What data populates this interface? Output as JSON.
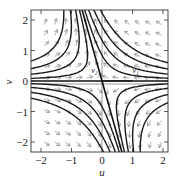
{
  "chart_data": {
    "type": "phase_portrait",
    "title": "",
    "xlabel": "u",
    "ylabel": "v",
    "xlim": [
      -2.3,
      2.2
    ],
    "ylim": [
      -2.3,
      2.3
    ],
    "x_ticks": [
      -2,
      -1,
      0,
      1,
      2
    ],
    "y_ticks": [
      -2,
      -1,
      0,
      1,
      2
    ],
    "x_tick_labels": [
      "−2",
      "−1",
      "0",
      "1",
      "2"
    ],
    "y_tick_labels": [
      "−2",
      "−1",
      "0",
      "1",
      "2"
    ],
    "grid": false,
    "equilibrium": {
      "u": 0,
      "v": 0,
      "kind": "saddle"
    },
    "eigenvectors": [
      {
        "name": "v1",
        "label": "v₁",
        "direction": [
          1,
          0
        ],
        "stability": "stable",
        "label_pos": [
          1.0,
          0.25
        ]
      },
      {
        "name": "v2",
        "label": "v₂",
        "direction": [
          -0.28,
          1
        ],
        "stability": "unstable",
        "label_pos": [
          -0.35,
          0.25
        ]
      }
    ],
    "trajectory_constants": [
      -1.4,
      -0.9,
      -0.5,
      -0.2,
      0.2,
      0.5,
      0.9,
      1.4
    ],
    "direction_field": {
      "u_range": [
        -1.9,
        2.0
      ],
      "v_range": [
        -2.0,
        2.0
      ],
      "spacing": 0.35,
      "arrow_color": "#888888"
    },
    "colors": {
      "trajectory": "#1a1a1a",
      "frame": "#333333",
      "arrows": "#8a8a8a"
    }
  }
}
